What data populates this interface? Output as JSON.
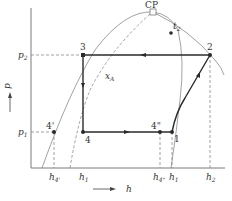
{
  "diagram": {
    "type": "p-h refrigeration cycle diagram",
    "axes": {
      "y_label": "p",
      "x_label": "h"
    },
    "pressure_levels": [
      {
        "id": "p2",
        "label": "p",
        "sub": "2"
      },
      {
        "id": "p1",
        "label": "p",
        "sub": "1"
      }
    ],
    "enthalpy_ticks": [
      {
        "id": "h4p",
        "label": "h",
        "sub": "4'"
      },
      {
        "id": "h1a",
        "label": "h",
        "sub": "1"
      },
      {
        "id": "h4pp",
        "label": "h",
        "sub": "4\""
      },
      {
        "id": "h1b",
        "label": "h",
        "sub": "1"
      },
      {
        "id": "h2",
        "label": "h",
        "sub": "2"
      }
    ],
    "points": {
      "cp": "CP",
      "t2": {
        "label": "t",
        "sub": "2"
      },
      "p1": "1",
      "p2": "2",
      "p3": "3",
      "p4": "4",
      "p4p": "4'",
      "p4pp": "4\""
    },
    "quality_line": {
      "label": "x",
      "sub": "A"
    },
    "colors": {
      "cycle": "#2a2a2a",
      "dome": "#8a8a8a",
      "dashed": "#8a8a8a",
      "axes": "#7a7a7a"
    }
  }
}
